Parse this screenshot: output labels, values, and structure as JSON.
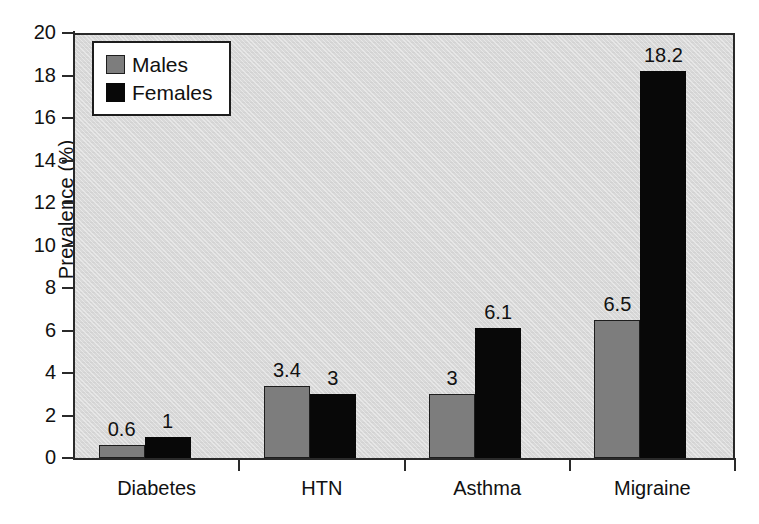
{
  "chart_data": {
    "type": "bar",
    "title": "",
    "xlabel": "",
    "ylabel": "Prevalence (%)",
    "categories": [
      "Diabetes",
      "HTN",
      "Asthma",
      "Migraine"
    ],
    "series": [
      {
        "name": "Males",
        "color": "#7d7d7d",
        "values": [
          0.6,
          3.4,
          3,
          6.5
        ],
        "labels": [
          "0.6",
          "3.4",
          "3",
          "6.5"
        ]
      },
      {
        "name": "Females",
        "color": "#080808",
        "values": [
          1,
          3,
          6.1,
          18.2
        ],
        "labels": [
          "1",
          "3",
          "6.1",
          "18.2"
        ]
      }
    ],
    "ylim": [
      0,
      20
    ],
    "yticks": [
      0,
      2,
      4,
      6,
      8,
      10,
      12,
      14,
      16,
      18,
      20
    ],
    "ytick_labels": [
      "0",
      "2",
      "4",
      "6",
      "8",
      "10",
      "12",
      "14",
      "16",
      "18",
      "20"
    ],
    "grid": false,
    "legend_position": "top-left",
    "plot_background": "#d8d8d8"
  },
  "legend": {
    "items": [
      {
        "label": "Males",
        "swatch": "males"
      },
      {
        "label": "Females",
        "swatch": "females"
      }
    ]
  }
}
